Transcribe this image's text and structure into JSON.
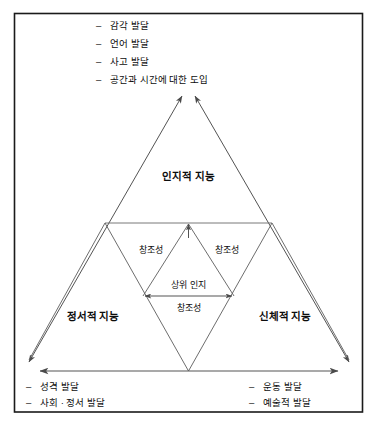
{
  "figure": {
    "title_label": "intelligence-triangle-diagram",
    "language": "ko"
  },
  "top_list": {
    "bullet": "–",
    "items": [
      "감각 발달",
      "언어 발달",
      "사고 발달",
      "공간과 시간에 대한 도입"
    ]
  },
  "bottom_left_list": {
    "bullet": "–",
    "items": [
      "성격 발달",
      "사회 · 정서 발달"
    ]
  },
  "bottom_right_list": {
    "bullet": "–",
    "items": [
      "운동 발달",
      "예술적 발달"
    ]
  },
  "nodes": {
    "cognitive": "인지적 지능",
    "emotional": "정서적 지능",
    "physical": "신체적 지능"
  },
  "inner_labels": {
    "creativity_left": "창조성",
    "creativity_right": "창조성",
    "creativity_bottom": "창조성",
    "metacognition": "상위 인지"
  },
  "colors": {
    "frame": "#1a1a1a",
    "triangle_line": "#5c5c5c",
    "text": "#0d0d0d",
    "background": "#ffffff"
  }
}
